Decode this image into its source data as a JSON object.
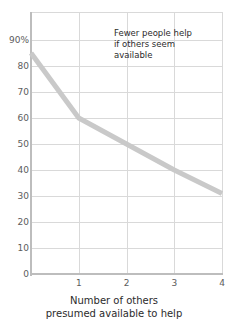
{
  "chart_data": {
    "type": "line",
    "title": "",
    "subtitle": "",
    "xlabel_lines": [
      "Number of others",
      "presumed available to help"
    ],
    "ylabel": "",
    "x": [
      0,
      1,
      2,
      3,
      4
    ],
    "values": [
      85,
      60,
      50,
      40,
      31
    ],
    "series": [
      {
        "name": "Percentage who help",
        "values": [
          85,
          60,
          50,
          40,
          31
        ]
      }
    ],
    "xlim": [
      0,
      4
    ],
    "ylim": [
      0,
      95
    ],
    "xticks": [
      "1",
      "2",
      "3",
      "4"
    ],
    "xtick_values": [
      1,
      2,
      3,
      4
    ],
    "yticks": [
      "90%",
      "80",
      "70",
      "60",
      "50",
      "40",
      "30",
      "20",
      "10",
      "0"
    ],
    "ytick_values": [
      90,
      80,
      70,
      60,
      50,
      40,
      30,
      20,
      10,
      0
    ],
    "grid": true,
    "legend": "none",
    "annotations": [
      {
        "name": "callout",
        "lines": [
          "Fewer people help",
          "if others seem",
          "available"
        ]
      }
    ],
    "colors": {
      "line": "#c9c9c9",
      "grid": "#d9d9d9",
      "axis": "#bdbdbd",
      "tick_text": "#5c5c5c",
      "text": "#2b2b2b",
      "background": "#ffffff"
    }
  },
  "annotation": {
    "line1": "Fewer people help",
    "line2": "if others seem",
    "line3": "available"
  },
  "xaxis": {
    "title_line1": "Number of others",
    "title_line2": "presumed available to help"
  }
}
